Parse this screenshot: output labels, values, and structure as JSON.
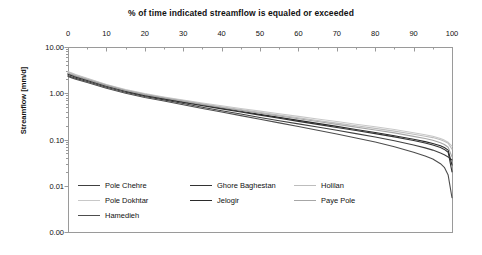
{
  "chart_data": {
    "type": "line",
    "title": "% of time indicated streamflow is equaled or exceeded",
    "xlabel": "",
    "ylabel": "Streamflow [mm/d]",
    "xlim": [
      0,
      100
    ],
    "x_tick_labels": [
      "0",
      "10",
      "20",
      "30",
      "40",
      "50",
      "60",
      "70",
      "80",
      "90",
      "100"
    ],
    "x_tick_values": [
      0,
      10,
      20,
      30,
      40,
      50,
      60,
      70,
      80,
      90,
      100
    ],
    "x_axis_position": "top",
    "x_minor_tick_interval": 5,
    "yscale": "log",
    "ylim": [
      0.001,
      10
    ],
    "y_tick_labels": [
      "10.00",
      "1.00",
      "0.10",
      "0.01",
      "0.00"
    ],
    "y_tick_values": [
      10,
      1,
      0.1,
      0.01,
      0.001
    ],
    "grid": false,
    "legend_position": "inside-bottom-left",
    "legend_columns": 3,
    "x": [
      0,
      1,
      2,
      5,
      10,
      15,
      20,
      25,
      30,
      35,
      40,
      45,
      50,
      55,
      60,
      65,
      70,
      75,
      80,
      85,
      90,
      93,
      95,
      97,
      98,
      99,
      100
    ],
    "series": [
      {
        "name": "Pole Chehre",
        "color": "#404040",
        "values": [
          2.4,
          2.25,
          2.1,
          1.8,
          1.35,
          1.05,
          0.85,
          0.72,
          0.6,
          0.5,
          0.42,
          0.355,
          0.3,
          0.255,
          0.218,
          0.186,
          0.158,
          0.134,
          0.113,
          0.094,
          0.076,
          0.066,
          0.059,
          0.051,
          0.047,
          0.042,
          0.036
        ]
      },
      {
        "name": "Pole Dokhtar",
        "color": "#c8c8c8",
        "values": [
          2.95,
          2.75,
          2.55,
          2.1,
          1.55,
          1.2,
          0.98,
          0.83,
          0.71,
          0.615,
          0.535,
          0.468,
          0.41,
          0.36,
          0.316,
          0.278,
          0.244,
          0.214,
          0.188,
          0.164,
          0.14,
          0.127,
          0.118,
          0.105,
          0.097,
          0.087,
          0.072
        ]
      },
      {
        "name": "Hamedieh",
        "color": "#4d4d4d",
        "values": [
          2.3,
          2.15,
          2.0,
          1.7,
          1.28,
          1.0,
          0.81,
          0.68,
          0.565,
          0.47,
          0.392,
          0.328,
          0.274,
          0.229,
          0.191,
          0.159,
          0.132,
          0.108,
          0.088,
          0.07,
          0.053,
          0.044,
          0.038,
          0.03,
          0.025,
          0.017,
          0.0055
        ]
      },
      {
        "name": "Ghore Baghestan",
        "color": "#333333",
        "values": [
          2.55,
          2.38,
          2.22,
          1.88,
          1.42,
          1.1,
          0.89,
          0.75,
          0.635,
          0.54,
          0.46,
          0.393,
          0.336,
          0.288,
          0.247,
          0.212,
          0.182,
          0.156,
          0.134,
          0.114,
          0.095,
          0.084,
          0.076,
          0.067,
          0.061,
          0.053,
          0.02
        ]
      },
      {
        "name": "Jelogir",
        "color": "#2b2b2b",
        "values": [
          2.65,
          2.48,
          2.32,
          1.95,
          1.46,
          1.13,
          0.92,
          0.775,
          0.655,
          0.558,
          0.476,
          0.408,
          0.35,
          0.301,
          0.259,
          0.223,
          0.192,
          0.165,
          0.142,
          0.121,
          0.101,
          0.09,
          0.082,
          0.073,
          0.067,
          0.059,
          0.028
        ]
      },
      {
        "name": "Holilan",
        "color": "#bdbdbd",
        "values": [
          2.85,
          2.66,
          2.48,
          2.05,
          1.52,
          1.18,
          0.96,
          0.812,
          0.692,
          0.594,
          0.512,
          0.444,
          0.386,
          0.337,
          0.295,
          0.258,
          0.226,
          0.198,
          0.174,
          0.152,
          0.13,
          0.118,
          0.11,
          0.099,
          0.092,
          0.083,
          0.062
        ]
      },
      {
        "name": "Paye Pole",
        "color": "#a6a6a6",
        "values": [
          2.72,
          2.54,
          2.37,
          1.98,
          1.48,
          1.15,
          0.935,
          0.79,
          0.672,
          0.575,
          0.494,
          0.427,
          0.37,
          0.321,
          0.28,
          0.244,
          0.212,
          0.185,
          0.161,
          0.139,
          0.117,
          0.105,
          0.096,
          0.085,
          0.078,
          0.068,
          0.042
        ]
      }
    ]
  },
  "legend": {
    "items": [
      {
        "label": "Pole Chehre",
        "color": "#404040",
        "col": 0,
        "row": 0
      },
      {
        "label": "Pole Dokhtar",
        "color": "#c8c8c8",
        "col": 0,
        "row": 1
      },
      {
        "label": "Hamedieh",
        "color": "#4d4d4d",
        "col": 0,
        "row": 2
      },
      {
        "label": "Ghore Baghestan",
        "color": "#333333",
        "col": 1,
        "row": 0
      },
      {
        "label": "Jelogir",
        "color": "#2b2b2b",
        "col": 1,
        "row": 1
      },
      {
        "label": "Holilan",
        "color": "#bdbdbd",
        "col": 2,
        "row": 0
      },
      {
        "label": "Paye Pole",
        "color": "#a6a6a6",
        "col": 2,
        "row": 1
      }
    ]
  },
  "style": {
    "axis_color": "#9a9a9a",
    "text_color": "#111111",
    "background": "#ffffff"
  }
}
